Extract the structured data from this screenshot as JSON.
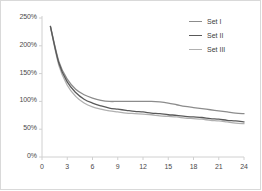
{
  "chart_data": {
    "type": "line",
    "title": "",
    "xlabel": "",
    "ylabel": "",
    "xlim": [
      0,
      24
    ],
    "ylim": [
      0,
      250
    ],
    "grid": false,
    "legend_position": "top-right",
    "y_tick_labels": [
      "0%",
      "50%",
      "100%",
      "150%",
      "200%",
      "250%"
    ],
    "y_tick_values": [
      0,
      50,
      100,
      150,
      200,
      250
    ],
    "x_tick_labels": [
      "0",
      "3",
      "6",
      "9",
      "12",
      "15",
      "18",
      "21",
      "24"
    ],
    "x_tick_values": [
      0,
      3,
      6,
      9,
      12,
      15,
      18,
      21,
      24
    ],
    "x": [
      1,
      2,
      3,
      4,
      5,
      6,
      7,
      8,
      9,
      10,
      11,
      12,
      13,
      14,
      15,
      16,
      17,
      18,
      19,
      20,
      21,
      22,
      23,
      24
    ],
    "series": [
      {
        "name": "Set I",
        "color": "#8c8c8c",
        "values": [
          235,
          172,
          140,
          122,
          112,
          106,
          102,
          100,
          100,
          100,
          100,
          100,
          100,
          99,
          97,
          94,
          91,
          89,
          87,
          85,
          83,
          81,
          79,
          78
        ]
      },
      {
        "name": "Set II",
        "color": "#595959",
        "values": [
          235,
          169,
          135,
          116,
          104,
          97,
          92,
          88,
          86,
          84,
          82,
          81,
          79,
          78,
          76,
          75,
          73,
          72,
          71,
          69,
          68,
          66,
          65,
          63
        ]
      },
      {
        "name": "Set III",
        "color": "#b0b0b0",
        "values": [
          234,
          165,
          129,
          109,
          97,
          90,
          86,
          83,
          81,
          79,
          78,
          77,
          76,
          74,
          73,
          72,
          70,
          69,
          68,
          66,
          65,
          63,
          61,
          60
        ]
      }
    ]
  },
  "legend": {
    "items": [
      {
        "label": "Set I"
      },
      {
        "label": "Set II"
      },
      {
        "label": "Set III"
      }
    ]
  },
  "axis": {
    "line_color": "#d0d0d0"
  }
}
